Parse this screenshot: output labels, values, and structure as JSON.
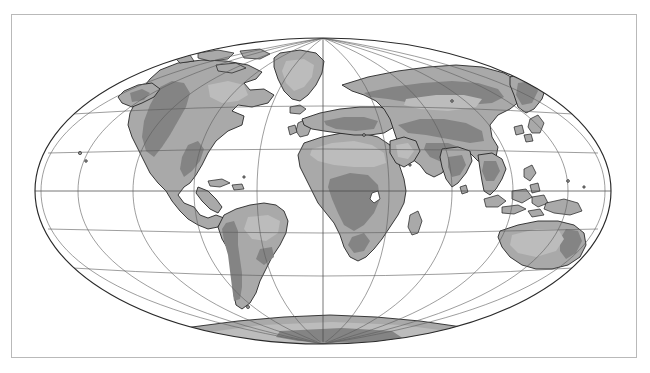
{
  "figure": {
    "projection_name": "Mollweide (elliptical equal-area)",
    "frame": {
      "border_color": "#b9b9b9",
      "background": "#ffffff"
    }
  },
  "map": {
    "ocean_color": "#ffffff",
    "land_color": "#a9a9a9",
    "highland_color": "#848484",
    "lowland_color": "#bcbcbc",
    "coastline_color": "#1d1d1d",
    "graticule_color": "#5c5c5c",
    "outline_color": "#2a2a2a",
    "ellipse": {
      "cx": 311,
      "cy": 176,
      "rx": 288,
      "ry": 153
    },
    "graticule": {
      "meridian_interval_deg": 30,
      "parallel_interval_deg": 30,
      "meridians_deg": [
        -180,
        -150,
        -120,
        -90,
        -60,
        -30,
        0,
        30,
        60,
        90,
        120,
        150,
        180
      ],
      "parallels_deg": [
        -60,
        -30,
        0,
        30,
        60
      ],
      "equator_highlighted": true
    },
    "landmasses": [
      {
        "name": "north-america",
        "label": "North America"
      },
      {
        "name": "south-america",
        "label": "South America"
      },
      {
        "name": "greenland",
        "label": "Greenland"
      },
      {
        "name": "eurasia",
        "label": "Eurasia"
      },
      {
        "name": "africa",
        "label": "Africa"
      },
      {
        "name": "australia",
        "label": "Australia"
      },
      {
        "name": "antarctica",
        "label": "Antarctica"
      },
      {
        "name": "madagascar",
        "label": "Madagascar"
      },
      {
        "name": "new-zealand",
        "label": "New Zealand"
      },
      {
        "name": "japan",
        "label": "Japan"
      },
      {
        "name": "british-isles",
        "label": "British Isles"
      },
      {
        "name": "indonesia",
        "label": "Indonesian Archipelago"
      },
      {
        "name": "philippines",
        "label": "Philippines"
      },
      {
        "name": "iceland",
        "label": "Iceland"
      },
      {
        "name": "new-guinea",
        "label": "New Guinea"
      },
      {
        "name": "borneo",
        "label": "Borneo"
      },
      {
        "name": "sumatra",
        "label": "Sumatra"
      },
      {
        "name": "cuba",
        "label": "Cuba"
      },
      {
        "name": "sri-lanka",
        "label": "Sri Lanka"
      },
      {
        "name": "svalbard",
        "label": "Svalbard"
      }
    ]
  }
}
